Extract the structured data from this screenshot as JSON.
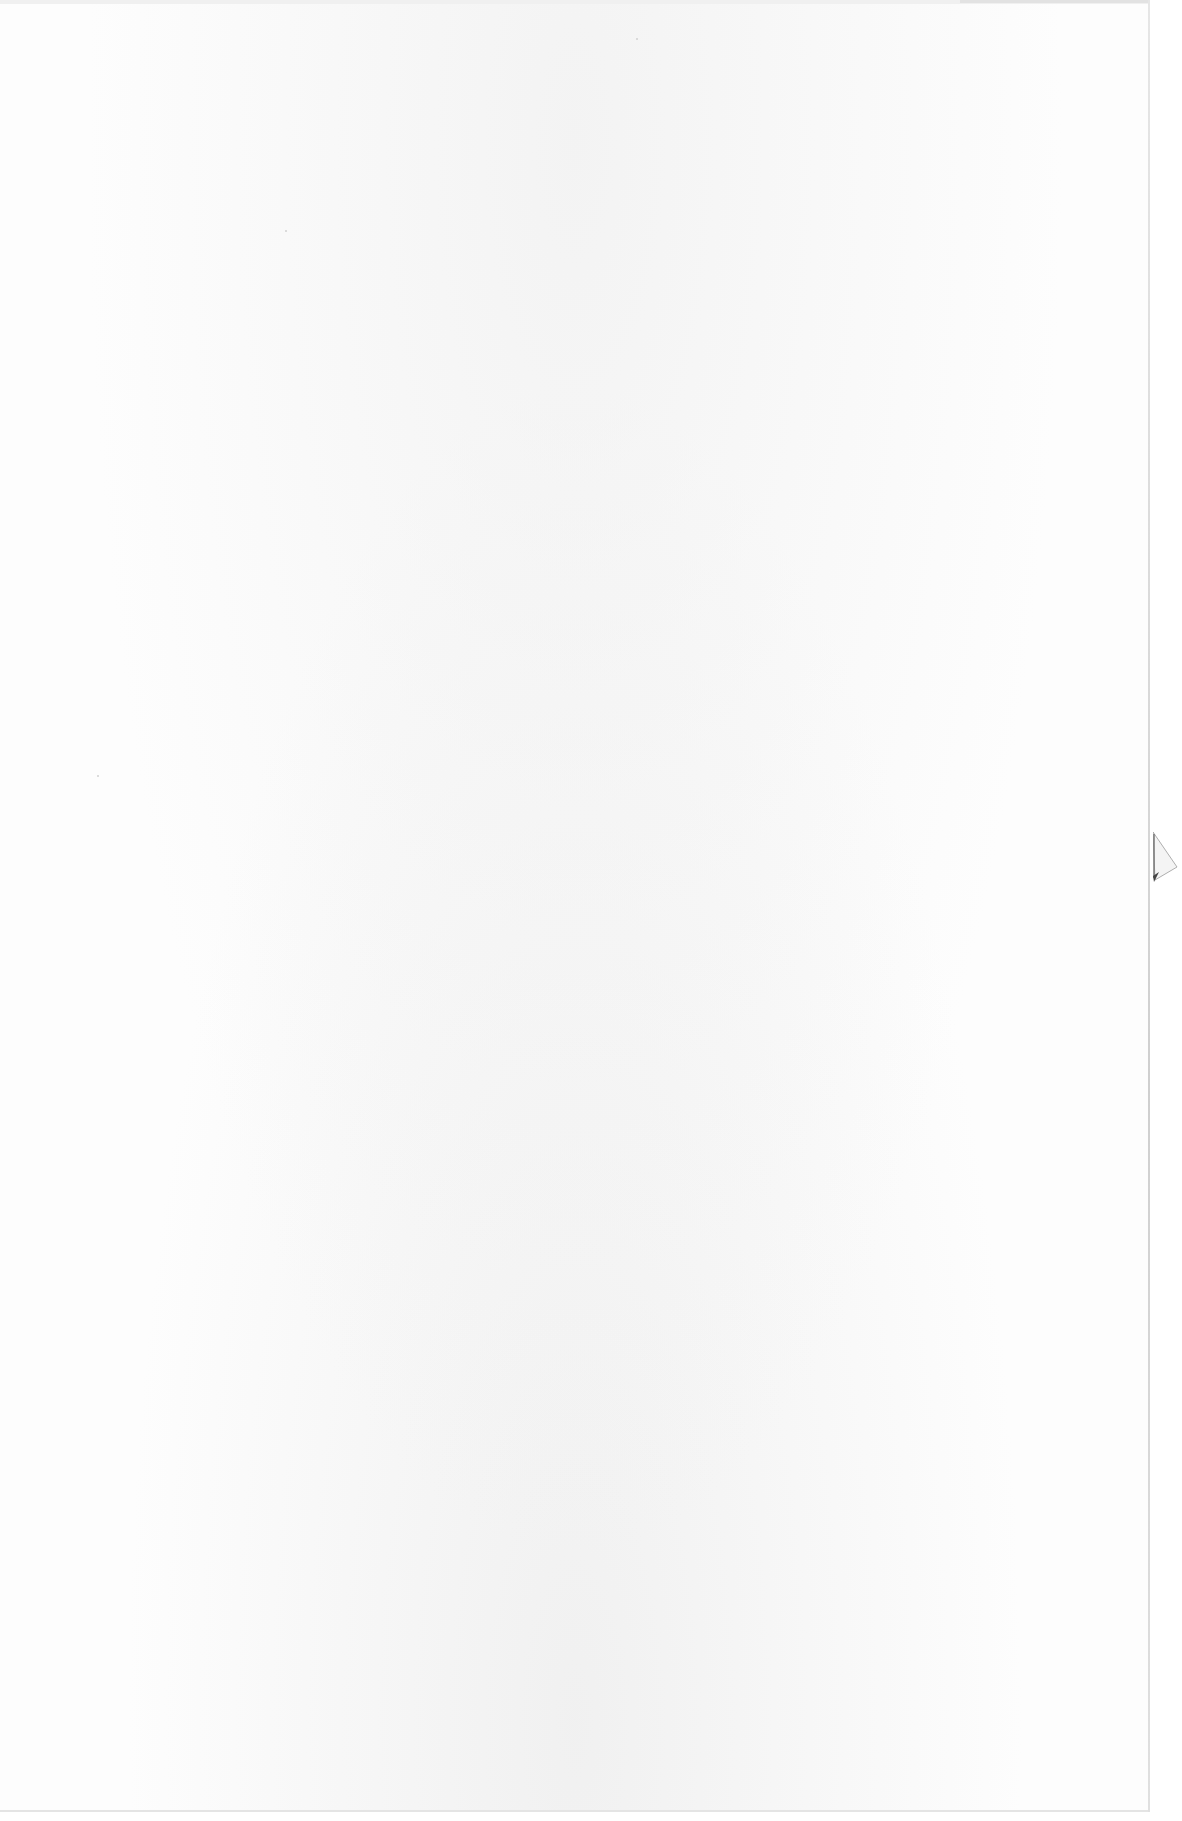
{
  "document": {
    "type": "blank scanned page",
    "text_content": "",
    "colors": {
      "paper": "#fdfdfd",
      "edge_shadow": "#d8d8d8",
      "fold_shadow": "#555555"
    }
  }
}
